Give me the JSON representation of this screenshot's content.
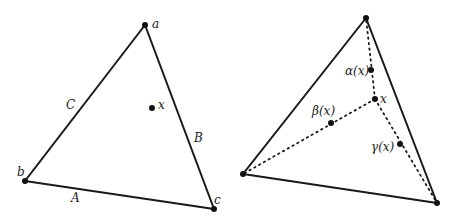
{
  "left_diagram": {
    "vertices": {
      "a": [
        145,
        25
      ],
      "b": [
        25,
        181
      ],
      "c": [
        214,
        209
      ]
    },
    "point_x": [
      152,
      108
    ],
    "labels": {
      "a": "a",
      "b": "b",
      "c": "c",
      "x": "x",
      "side_A": "A",
      "side_B": "B",
      "side_C": "C"
    }
  },
  "right_diagram": {
    "vertices": {
      "top": [
        366,
        18
      ],
      "left": [
        243,
        174
      ],
      "right": [
        437,
        203
      ]
    },
    "point_x": [
      375,
      99
    ],
    "alpha_point": [
      371,
      70
    ],
    "beta_point": [
      331,
      123
    ],
    "gamma_point": [
      400,
      144
    ],
    "labels": {
      "x": "x",
      "alpha": "α(x)",
      "beta": "β(x)",
      "gamma": "γ(x)"
    }
  },
  "colors": {
    "stroke": "#1a1a1a",
    "text": "#222222"
  }
}
